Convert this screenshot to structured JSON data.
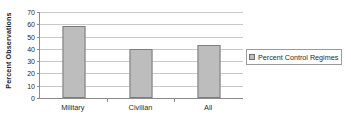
{
  "chart_data": {
    "type": "bar",
    "title": "",
    "subtitle": "",
    "xlabel": "",
    "ylabel": "Percent Observations",
    "categories": [
      "Military",
      "Civilian",
      "All"
    ],
    "series": [
      {
        "name": "Percent Control Regimes",
        "values": [
          59,
          40,
          43
        ],
        "color": "#BDBDBD",
        "border_color": "#7D7D7D"
      }
    ],
    "ylim": [
      0,
      70
    ],
    "ytick_step": 10,
    "yticks": [
      0,
      10,
      20,
      30,
      40,
      50,
      60,
      70
    ],
    "ytick_labels": [
      "0",
      "10",
      "20",
      "30",
      "40",
      "50",
      "60",
      "70"
    ],
    "grid": {
      "horizontal": true,
      "vertical": false,
      "color": "#C9C9C9"
    },
    "legend": {
      "position": "right",
      "entries": [
        "Percent Control Regimes"
      ],
      "bordered": true
    },
    "axis_color": "#8A8A8A",
    "background": "#FFFFFF"
  }
}
